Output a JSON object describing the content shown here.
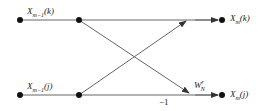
{
  "diagram": {
    "type": "butterfly",
    "colors": {
      "line": "#555555",
      "node": "#111111"
    },
    "labels": {
      "input_top": {
        "base": "X",
        "sub": "m−1",
        "arg": "(k)"
      },
      "input_bottom": {
        "base": "X",
        "sub": "m−1",
        "arg": "(j)"
      },
      "output_top": {
        "base": "X",
        "sub": "m",
        "arg": "(k)"
      },
      "output_bottom": {
        "base": "X",
        "sub": "m",
        "arg": "(j)"
      },
      "twiddle": {
        "base": "W",
        "sub": "N",
        "sup": "r"
      },
      "minus_one": "−1"
    }
  }
}
